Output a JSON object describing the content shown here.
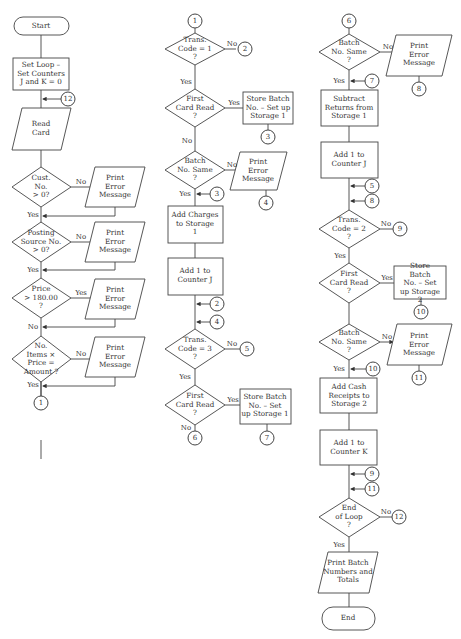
{
  "column1": {
    "start": "Start",
    "set_loop": "Set Loop –\nSet Counters\nJ and K = 0",
    "read_card": "Read\nCard",
    "cust_no": "Cust.\nNo.\n> 0?",
    "posting_source": "Posting\nSource No.\n> 0?",
    "price": "Price\n> 180.00\n?",
    "items_price": "No.\nItems ×\nPrice =\nAmount ?",
    "print_error_1": "Print\nError\nMessage",
    "print_error_2": "Print\nError\nMessage",
    "print_error_3": "Print\nError\nMessage",
    "print_error_4": "Print\nError\nMessage",
    "edge_no_1": "No",
    "edge_yes_1": "Yes",
    "edge_no_2": "No",
    "edge_yes_2": "Yes",
    "edge_yes_3": "Yes",
    "edge_no_3": "No",
    "edge_no_4": "No",
    "edge_yes_4": "Yes",
    "conn_12": "12",
    "conn_1": "1"
  },
  "column2": {
    "conn_1": "1",
    "trans_code_1": "Trans.\nCode = 1\n?",
    "edge_no_tc1": "No",
    "conn_2a": "2",
    "edge_yes_tc1": "Yes",
    "first_card_1": "First\nCard Read\n?",
    "edge_yes_fc1": "Yes",
    "store_batch_1": "Store Batch\nNo. – Set up\nStorage 1",
    "conn_3a": "3",
    "edge_no_fc1": "No",
    "batch_same_1": "Batch\nNo. Same\n?",
    "edge_no_bs1": "No",
    "print_error_5": "Print\nError\nMessage",
    "conn_4a": "4",
    "edge_yes_bs1": "Yes",
    "conn_3b": "3",
    "add_charges": "Add Charges\nto Storage\n1",
    "add_counter_j_1": "Add 1 to\nCounter J",
    "conn_2b": "2",
    "conn_4b": "4",
    "trans_code_3": "Trans.\nCode = 3\n?",
    "edge_no_tc3": "No",
    "conn_5a": "5",
    "edge_yes_tc3": "Yes",
    "first_card_2": "First\nCard Read\n?",
    "edge_yes_fc2": "Yes",
    "store_batch_2": "Store Batch\nNo. – Set\nup Storage 1",
    "edge_no_fc2": "No",
    "conn_6a": "6",
    "conn_7a": "7"
  },
  "column3": {
    "conn_6": "6",
    "batch_same_2": "Batch\nNo. Same\n?",
    "edge_no_bs2": "No",
    "print_error_6": "Print\nError\nMessage",
    "conn_8a": "8",
    "edge_yes_bs2": "Yes",
    "conn_7": "7",
    "subtract_returns": "Subtract\nReturns from\nStorage 1",
    "add_counter_j_2": "Add 1 to\nCounter J",
    "conn_5": "5",
    "conn_8b": "8",
    "trans_code_2": "Trans.\nCode = 2\n?",
    "edge_no_tc2": "No",
    "conn_9a": "9",
    "edge_yes_tc2": "Yes",
    "first_card_3": "First\nCard Read\n?",
    "edge_yes_fc3": "Yes",
    "store_batch_3": "Store Batch\nNo. – Set\nup Storage 2",
    "conn_10a": "10",
    "batch_same_3": "Batch\nNo. Same\n?",
    "edge_no_bs3": "No",
    "print_error_7": "Print\nError\nMessage",
    "conn_11a": "11",
    "edge_yes_bs3": "Yes",
    "conn_10b": "10",
    "add_cash": "Add Cash\nReceipts to\nStorage 2",
    "add_counter_k": "Add 1 to\nCounter K",
    "conn_9b": "9",
    "conn_11b": "11",
    "end_loop": "End\nof Loop\n?",
    "edge_no_el": "No",
    "conn_12": "12",
    "edge_yes_el": "Yes",
    "print_batch": "Print Batch\nNumbers and\nTotals",
    "end": "End"
  }
}
